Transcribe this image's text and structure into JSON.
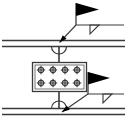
{
  "document": {
    "title": "Bolted Splice Connection Detail",
    "type": "engineering-drawing",
    "background_color": "#ffffff",
    "line_color": "#3a3a3a",
    "fill_color": "#000000",
    "width": 127,
    "height": 123
  },
  "canvas": {
    "stroke_width_member": 1.4,
    "stroke_width_symbol": 1.0,
    "stroke_width_thin": 0.9
  },
  "members": [
    {
      "name": "upper-member",
      "label": "Upper beam flange",
      "x1": 2,
      "x2": 125,
      "y_top": 40.5,
      "y_bottom": 46.5
    },
    {
      "name": "lower-member",
      "label": "Lower beam flange",
      "x1": 2,
      "x2": 125,
      "y_top": 108.5,
      "y_bottom": 114.5
    }
  ],
  "splice_plate": {
    "name": "splice-plate",
    "label": "Bolted splice plate",
    "x": 32,
    "y": 62,
    "width": 54,
    "height": 29,
    "rows": 2,
    "columns": 4,
    "bolt_symbol": "bolt-cross-circle",
    "bolt_radius": 2.6,
    "bolt_positions": [
      {
        "cx": 41,
        "cy": 70
      },
      {
        "cx": 53,
        "cy": 70
      },
      {
        "cx": 65,
        "cy": 70
      },
      {
        "cx": 77,
        "cy": 70
      },
      {
        "cx": 41,
        "cy": 83
      },
      {
        "cx": 53,
        "cy": 83
      },
      {
        "cx": 65,
        "cy": 83
      },
      {
        "cx": 77,
        "cy": 83
      }
    ]
  },
  "stems": [
    {
      "name": "upper-stem",
      "x": 59,
      "y1": 46.5,
      "y2": 62
    },
    {
      "name": "lower-stem",
      "x": 59,
      "y1": 91,
      "y2": 108.5
    }
  ],
  "weld_arcs": [
    {
      "name": "upper-plug-weld-arc",
      "label": "Plug / slot weld at upper member",
      "cx": 59,
      "cy": 46.5,
      "r": 7.5
    },
    {
      "name": "lower-plug-weld-arc",
      "label": "Plug / slot weld at lower member",
      "cx": 59,
      "cy": 108.5,
      "r": 7.5
    }
  ],
  "annotations": [
    {
      "name": "upper-weld-callout",
      "label": "Upper field fillet weld callout",
      "leader": {
        "x1": 59.5,
        "y1": 42.5,
        "x2": 76,
        "y2": 25
      },
      "arrowhead": {
        "x": 59.5,
        "y": 42.5,
        "angle": 226
      },
      "reference_line": {
        "x1": 76,
        "y1": 25,
        "x2": 124,
        "y2": 25
      },
      "flag": {
        "name": "field-weld-flag",
        "pole_x": 76,
        "pole_y_top": 3,
        "pole_y_bottom": 25,
        "banner_points": "76,3 99,9.5 76,16"
      },
      "weld_symbol": {
        "name": "fillet-weld-triangle",
        "side": "below-reference-line",
        "points": "90,25 90,34 99,25"
      }
    },
    {
      "name": "lower-weld-callout",
      "label": "Lower field fillet weld callout",
      "leader": {
        "x1": 62,
        "y1": 112,
        "x2": 88,
        "y2": 94
      },
      "arrowhead": {
        "x": 62,
        "y": 112,
        "angle": 215
      },
      "reference_line": {
        "x1": 88,
        "y1": 94,
        "x2": 124,
        "y2": 94
      },
      "flag": {
        "name": "field-weld-flag",
        "pole_x": 88,
        "pole_y_top": 72,
        "pole_y_bottom": 94,
        "banner_points": "88,72 110,78 88,84.5"
      },
      "weld_symbol": {
        "name": "fillet-weld-triangle",
        "side": "below-reference-line",
        "points": "103,94 103,103 112,94"
      }
    }
  ]
}
